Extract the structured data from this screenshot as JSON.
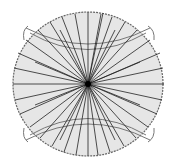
{
  "diagram": {
    "type": "radial-lines-in-circle",
    "center": [
      88,
      84
    ],
    "circle": {
      "rx": 75,
      "ry": 72,
      "fill": "#e6e6e6",
      "stroke": "#666666"
    },
    "ray_color": "#222222",
    "band_color": "#777777",
    "rays": [
      [
        88,
        12
      ],
      [
        101,
        14
      ],
      [
        112,
        17
      ],
      [
        125,
        22
      ],
      [
        137,
        30
      ],
      [
        150,
        40
      ],
      [
        160,
        53
      ],
      [
        163,
        68
      ],
      [
        164,
        84
      ],
      [
        162,
        100
      ],
      [
        157,
        114
      ],
      [
        148,
        127
      ],
      [
        136,
        138
      ],
      [
        124,
        146
      ],
      [
        110,
        152
      ],
      [
        98,
        155
      ],
      [
        88,
        156
      ],
      [
        76,
        155
      ],
      [
        64,
        152
      ],
      [
        52,
        146
      ],
      [
        40,
        138
      ],
      [
        30,
        127
      ],
      [
        20,
        114
      ],
      [
        15,
        100
      ],
      [
        13,
        84
      ],
      [
        14,
        68
      ],
      [
        18,
        53
      ],
      [
        26,
        40
      ],
      [
        38,
        30
      ],
      [
        50,
        22
      ],
      [
        62,
        17
      ],
      [
        75,
        14
      ],
      [
        103,
        13
      ],
      [
        60,
        30
      ],
      [
        115,
        30
      ],
      [
        35,
        62
      ],
      [
        140,
        62
      ],
      [
        35,
        105
      ],
      [
        140,
        105
      ],
      [
        60,
        140
      ],
      [
        115,
        140
      ]
    ],
    "bands": {
      "top": {
        "outer": "M26,28 Q88,60 150,28",
        "inner": "M30,33 Q88,66 146,33"
      },
      "bottom": {
        "outer": "M26,140 Q88,108 150,140",
        "inner": "M30,135 Q88,102 146,135"
      }
    },
    "ears": [
      "M28,26 Q22,30 24,40",
      "M148,26 Q155,30 154,40",
      "M28,142 Q22,138 24,128",
      "M148,142 Q155,138 154,128"
    ]
  }
}
